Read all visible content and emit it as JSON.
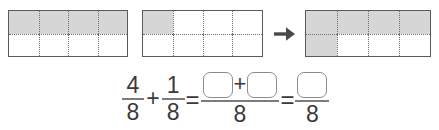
{
  "worksheet": {
    "type": "fraction-addition-area-model",
    "denominator": 8,
    "parts_per_model": 8,
    "rows": 2,
    "columns": 4,
    "colors": {
      "shaded_fill": "#d6d6d6",
      "unshaded_fill": "#ffffff",
      "outline": "#5b5b5b",
      "grid_line": "#6d6d6d",
      "text": "#3a3a3a",
      "box_outline": "#8c8c8c",
      "fraction_bar": "#7c7c7c"
    }
  },
  "models": [
    {
      "id": "model-1",
      "label": "four-eighths-model",
      "shaded_count": 4,
      "total_count": 8,
      "fraction_text": "4/8",
      "cells": [
        {
          "index": 1,
          "shaded": true
        },
        {
          "index": 2,
          "shaded": true
        },
        {
          "index": 3,
          "shaded": true
        },
        {
          "index": 4,
          "shaded": true
        },
        {
          "index": 5,
          "shaded": false
        },
        {
          "index": 6,
          "shaded": false
        },
        {
          "index": 7,
          "shaded": false
        },
        {
          "index": 8,
          "shaded": false
        }
      ]
    },
    {
      "id": "model-2",
      "label": "one-eighth-model",
      "shaded_count": 1,
      "total_count": 8,
      "fraction_text": "1/8",
      "cells": [
        {
          "index": 1,
          "shaded": true
        },
        {
          "index": 2,
          "shaded": false
        },
        {
          "index": 3,
          "shaded": false
        },
        {
          "index": 4,
          "shaded": false
        },
        {
          "index": 5,
          "shaded": false
        },
        {
          "index": 6,
          "shaded": false
        },
        {
          "index": 7,
          "shaded": false
        },
        {
          "index": 8,
          "shaded": false
        }
      ]
    },
    {
      "id": "model-3",
      "label": "five-eighths-sum-model",
      "shaded_count": 5,
      "total_count": 8,
      "fraction_text": "5/8",
      "cells": [
        {
          "index": 1,
          "shaded": true
        },
        {
          "index": 2,
          "shaded": true
        },
        {
          "index": 3,
          "shaded": true
        },
        {
          "index": 4,
          "shaded": true
        },
        {
          "index": 5,
          "shaded": true
        },
        {
          "index": 6,
          "shaded": false
        },
        {
          "index": 7,
          "shaded": false
        },
        {
          "index": 8,
          "shaded": false
        }
      ]
    }
  ],
  "arrow": {
    "name": "right-arrow-icon",
    "glyph": "→",
    "direction": "right"
  },
  "equation": {
    "term1": {
      "numerator": "4",
      "denominator": "8"
    },
    "operator_add": "+",
    "term2": {
      "numerator": "1",
      "denominator": "8"
    },
    "operator_equals_1": "=",
    "sum_expression": {
      "numerator_box_1": "",
      "inline_plus": "+",
      "numerator_box_2": "",
      "denominator": "8"
    },
    "operator_equals_2": "=",
    "result": {
      "numerator_box": "",
      "denominator": "8"
    }
  }
}
